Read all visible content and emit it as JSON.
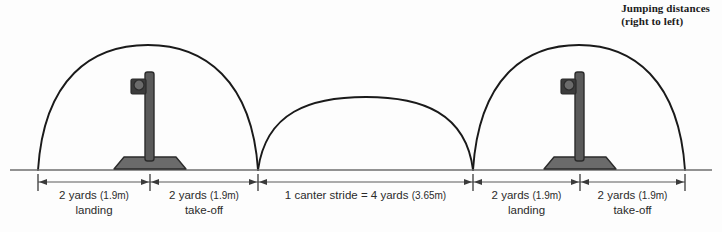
{
  "caption": {
    "line1": "Jumping distances",
    "line2": "(right to left)"
  },
  "colors": {
    "background": "#fdfdfd",
    "arc_stroke": "#1a1a1a",
    "ground_line": "#6e6e6e",
    "dimension_line": "#5a5a5a",
    "fence_post": "#5a5a5a",
    "fence_post_outline": "#2b2b2b",
    "fence_base": "#6b6b6b",
    "fence_base_outline": "#2b2b2b",
    "cup_block": "#3c3c3c",
    "cup_circle": "#6b6b6b",
    "text": "#2b2b2b"
  },
  "diagram": {
    "ground_y": 170,
    "dimension_y": 182,
    "ticks": [
      38,
      150,
      258,
      473,
      580,
      685
    ],
    "fences": [
      {
        "name": "fence-left",
        "x": 150,
        "top_y": 72,
        "base_y": 170
      },
      {
        "name": "fence-right",
        "x": 580,
        "top_y": 72,
        "base_y": 170
      }
    ],
    "arcs": [
      {
        "name": "jump-arc-left",
        "start_x": 38,
        "end_x": 258,
        "peak_y": 45
      },
      {
        "name": "canter-stride-arc",
        "start_x": 258,
        "end_x": 473,
        "peak_y": 97
      },
      {
        "name": "jump-arc-right",
        "start_x": 473,
        "end_x": 685,
        "peak_y": 45
      }
    ]
  },
  "segments": [
    {
      "name": "segment-landing-left",
      "distance": "2 yards",
      "metric": "(1.9m)",
      "phase": "landing",
      "start_x": 38,
      "end_x": 150
    },
    {
      "name": "segment-takeoff-left",
      "distance": "2 yards",
      "metric": "(1.9m)",
      "phase": "take-off",
      "start_x": 150,
      "end_x": 258
    },
    {
      "name": "segment-canter-stride",
      "distance": "1 canter stride = 4 yards",
      "metric": "(3.65m)",
      "phase": "",
      "start_x": 258,
      "end_x": 473
    },
    {
      "name": "segment-landing-right",
      "distance": "2 yards",
      "metric": "(1.9m)",
      "phase": "landing",
      "start_x": 473,
      "end_x": 580
    },
    {
      "name": "segment-takeoff-right",
      "distance": "2 yards",
      "metric": "(1.9m)",
      "phase": "take-off",
      "start_x": 580,
      "end_x": 685
    }
  ]
}
